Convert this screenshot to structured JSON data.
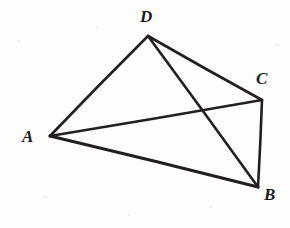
{
  "figure": {
    "canvas": {
      "width": 290,
      "height": 228
    },
    "background_color": "#fdfdfc",
    "ink_color": "#231f20",
    "vertices": [
      {
        "id": "A",
        "label": "A",
        "x": 50,
        "y": 136,
        "label_x": 22,
        "label_y": 128
      },
      {
        "id": "B",
        "label": "B",
        "x": 258,
        "y": 187,
        "label_x": 264,
        "label_y": 186
      },
      {
        "id": "C",
        "label": "C",
        "x": 262,
        "y": 100,
        "label_x": 256,
        "label_y": 70
      },
      {
        "id": "D",
        "label": "D",
        "x": 148,
        "y": 36,
        "label_x": 140,
        "label_y": 8
      }
    ],
    "edges": [
      {
        "id": "AD",
        "from": "A",
        "to": "D",
        "kind": "side",
        "width": 2.6
      },
      {
        "id": "DC",
        "from": "D",
        "to": "C",
        "kind": "side",
        "width": 2.6
      },
      {
        "id": "CB",
        "from": "C",
        "to": "B",
        "kind": "side",
        "width": 2.6
      },
      {
        "id": "BA",
        "from": "B",
        "to": "A",
        "kind": "side",
        "width": 3.2
      },
      {
        "id": "AC",
        "from": "A",
        "to": "C",
        "kind": "diagonal",
        "width": 2.4
      },
      {
        "id": "DB",
        "from": "D",
        "to": "B",
        "kind": "diagonal",
        "width": 2.6
      }
    ],
    "intersection": {
      "id": "AC-DB",
      "x": 197,
      "y": 117
    },
    "specks": [
      {
        "x": 18,
        "y": 40,
        "size": 2
      },
      {
        "x": 96,
        "y": 26,
        "size": 2
      },
      {
        "x": 44,
        "y": 196,
        "size": 2
      },
      {
        "x": 210,
        "y": 206,
        "size": 2
      },
      {
        "x": 276,
        "y": 44,
        "size": 2
      },
      {
        "x": 128,
        "y": 214,
        "size": 2
      }
    ]
  }
}
